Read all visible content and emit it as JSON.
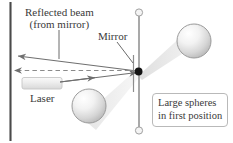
{
  "figure": {
    "type": "physics-diagram"
  },
  "labels": {
    "reflected_beam_line1": "Reflected beam",
    "reflected_beam_line2": "(from mirror)",
    "mirror": "Mirror",
    "laser": "Laser",
    "spheres_line1": "Large spheres",
    "spheres_line2": "in first position"
  },
  "elements": {
    "wall_name": "left-wall-line",
    "rod_name": "torsion-balance-rod",
    "pivot_name": "mirror-pivot-dot",
    "mirror_name": "mirror-line",
    "sphere_upper_right": "large-sphere-upper-right",
    "sphere_lower_left": "large-sphere-lower-left",
    "laser_body": "laser-device",
    "incident_beam": "incident-laser-beam-arrow",
    "reflected_beam": "reflected-beam-arrow",
    "dashed_reference": "dashed-reference-line",
    "beam_band_upper": "shaded-beam-band-upper-right",
    "beam_band_lower": "shaded-beam-band-lower-left"
  },
  "colors": {
    "ink": "#3a3a3a",
    "wall": "#4a4a4a",
    "rod": "#9a9a9a",
    "beam": "#6f6f6f",
    "band": "#e8e8e8",
    "sphere_edge": "#9b9b9b",
    "box_border": "#b9b9b9"
  }
}
